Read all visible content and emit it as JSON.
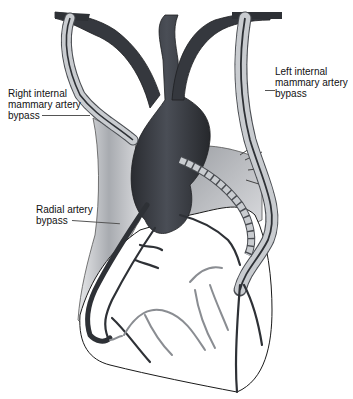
{
  "diagram": {
    "labels": {
      "right_ima": [
        "Right internal",
        "mammary artery",
        "bypass"
      ],
      "left_ima": [
        "Left internal",
        "mammary artery",
        "bypass"
      ],
      "radial": [
        "Radial artery",
        "bypass"
      ]
    },
    "colors": {
      "aorta": "#3a3d44",
      "graft_fill": "#c9ccd0",
      "graft_outline": "#4a4d52",
      "vessel_dark": "#2e3136",
      "vessel_light": "#8a8d92",
      "tissue_gray": "#b8bbbf",
      "outline": "#1a1a1a"
    }
  }
}
